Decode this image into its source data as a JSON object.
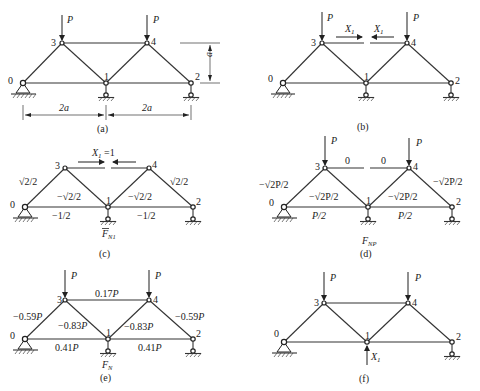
{
  "panels": [
    {
      "id": "a",
      "caption": "(a)",
      "loads": [
        "P",
        "P"
      ],
      "node_labels": [
        "0",
        "1",
        "2",
        "3",
        "4"
      ],
      "dimensions": {
        "height": "a",
        "span_left": "2a",
        "span_right": "2a"
      }
    },
    {
      "id": "b",
      "caption": "(b)",
      "loads": [
        "P",
        "P"
      ],
      "node_labels": [
        "0",
        "1",
        "2",
        "3",
        "4"
      ],
      "redundant_labels": [
        "X1",
        "X1"
      ]
    },
    {
      "id": "c",
      "caption": "(c)",
      "title_label": "X1 = 1",
      "diagram_label": "F̄N1",
      "node_labels": [
        "0",
        "1",
        "2",
        "3",
        "4"
      ],
      "member_forces": {
        "m03": "√2/2",
        "m31": "−√2/2",
        "m14": "−√2/2",
        "m42": "√2/2",
        "m01": "−1/2",
        "m12": "−1/2"
      }
    },
    {
      "id": "d",
      "caption": "(d)",
      "diagram_label": "FNP",
      "loads": [
        "P",
        "P"
      ],
      "node_labels": [
        "0",
        "1",
        "2",
        "3",
        "4"
      ],
      "member_forces": {
        "m34_left": "0",
        "m34_right": "0",
        "m03": "−√2P/2",
        "m31": "−√2P/2",
        "m14": "−√2P/2",
        "m42": "−√2P/2",
        "m01": "P/2",
        "m12": "P/2"
      }
    },
    {
      "id": "e",
      "caption": "(e)",
      "diagram_label": "FN",
      "loads": [
        "P",
        "P"
      ],
      "node_labels": [
        "0",
        "1",
        "2",
        "3",
        "4"
      ],
      "member_forces": {
        "m34": "0.17P",
        "m03": "−0.59P",
        "m31": "−0.83P",
        "m14": "−0.83P",
        "m42": "−0.59P",
        "m01": "0.41P",
        "m12": "0.41P"
      }
    },
    {
      "id": "f",
      "caption": "(f)",
      "loads": [
        "P",
        "P"
      ],
      "node_labels": [
        "0",
        "1",
        "2",
        "3",
        "4"
      ],
      "reaction_label": "X1"
    }
  ]
}
